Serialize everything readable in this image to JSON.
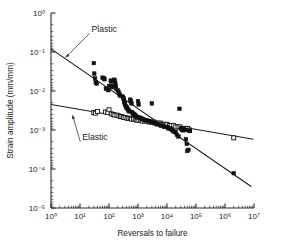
{
  "chart_data": {
    "type": "scatter",
    "title": "",
    "xlabel": "Reversals to failure",
    "ylabel": "Strain amplitude (mm/mm)",
    "xscale": "log",
    "yscale": "log",
    "xlim": [
      1,
      10000000
    ],
    "ylim": [
      1e-05,
      1
    ],
    "grid": false,
    "legend_position": "none",
    "xticks": [
      "10⁰",
      "10¹",
      "10²",
      "10³",
      "10⁴",
      "10⁵",
      "10⁶",
      "10⁷"
    ],
    "xtick_values": [
      1,
      10,
      100,
      1000,
      10000,
      100000,
      1000000,
      10000000
    ],
    "ytick_values": [
      1,
      0.1,
      0.01,
      0.001,
      0.0001,
      1e-05
    ],
    "yticks": [
      "10⁰",
      "10⁻¹",
      "10⁻²",
      "10⁻³",
      "10⁻⁴",
      "10⁻⁵"
    ],
    "annotations": [
      {
        "text": "Plastic",
        "x": 25,
        "y": 0.33,
        "points_to_x": 3.2,
        "points_to_y": 0.072
      },
      {
        "text": "Elastic",
        "x": 12,
        "y": 0.00055,
        "points_to_x": 5.5,
        "points_to_y": 0.0024
      }
    ],
    "series": [
      {
        "name": "Plastic strain amplitude",
        "marker": "filled-square",
        "color": "#111111",
        "fit_line": {
          "x": [
            1,
            8000000
          ],
          "y": [
            0.12,
            3.55e-05
          ],
          "slope_decades_per_decade": -0.5905
        },
        "points": [
          [
            30,
            0.052
          ],
          [
            31,
            0.028
          ],
          [
            33,
            0.021
          ],
          [
            35,
            0.0165
          ],
          [
            38,
            0.0155
          ],
          [
            60,
            0.022
          ],
          [
            66,
            0.0215
          ],
          [
            70,
            0.02
          ],
          [
            78,
            0.0115
          ],
          [
            95,
            0.0105
          ],
          [
            100,
            0.0135
          ],
          [
            115,
            0.0185
          ],
          [
            120,
            0.0175
          ],
          [
            125,
            0.0135
          ],
          [
            128,
            0.0125
          ],
          [
            150,
            0.0195
          ],
          [
            160,
            0.0185
          ],
          [
            165,
            0.0155
          ],
          [
            170,
            0.0135
          ],
          [
            175,
            0.0115
          ],
          [
            200,
            0.0105
          ],
          [
            215,
            0.0095
          ],
          [
            230,
            0.0082
          ],
          [
            245,
            0.0075
          ],
          [
            300,
            0.0072
          ],
          [
            315,
            0.0065
          ],
          [
            330,
            0.0058
          ],
          [
            340,
            0.0052
          ],
          [
            350,
            0.0048
          ],
          [
            360,
            0.0044
          ],
          [
            380,
            0.0041
          ],
          [
            400,
            0.0038
          ],
          [
            420,
            0.0036
          ],
          [
            450,
            0.0034
          ],
          [
            470,
            0.0032
          ],
          [
            500,
            0.003
          ],
          [
            540,
            0.006
          ],
          [
            560,
            0.0056
          ],
          [
            600,
            0.0048
          ],
          [
            620,
            0.0029
          ],
          [
            660,
            0.0027
          ],
          [
            700,
            0.0026
          ],
          [
            740,
            0.0025
          ],
          [
            800,
            0.0024
          ],
          [
            850,
            0.0023
          ],
          [
            900,
            0.0022
          ],
          [
            950,
            0.0021
          ],
          [
            1000,
            0.0055
          ],
          [
            1050,
            0.0045
          ],
          [
            1100,
            0.0021
          ],
          [
            1200,
            0.002
          ],
          [
            1300,
            0.002
          ],
          [
            1400,
            0.0019
          ],
          [
            1500,
            0.0019
          ],
          [
            1700,
            0.0018
          ],
          [
            1900,
            0.0018
          ],
          [
            2200,
            0.0017
          ],
          [
            2500,
            0.0017
          ],
          [
            2800,
            0.0016
          ],
          [
            3000,
            0.0048
          ],
          [
            3200,
            0.0016
          ],
          [
            3600,
            0.0015
          ],
          [
            4000,
            0.0015
          ],
          [
            4500,
            0.0014
          ],
          [
            5200,
            0.0014
          ],
          [
            6000,
            0.0013
          ],
          [
            7000,
            0.0013
          ],
          [
            8000,
            0.0012
          ],
          [
            9000,
            0.0012
          ],
          [
            10000,
            0.0012
          ],
          [
            11000,
            0.0011
          ],
          [
            13000,
            0.0011
          ],
          [
            15000,
            0.001
          ],
          [
            16000,
            0.00095
          ],
          [
            18000,
            0.0009
          ],
          [
            20000,
            0.00088
          ],
          [
            22000,
            0.00075
          ],
          [
            25000,
            0.00068
          ],
          [
            27000,
            0.0035
          ],
          [
            30000,
            0.0011
          ],
          [
            33000,
            0.001
          ],
          [
            36000,
            0.00098
          ],
          [
            38000,
            0.00105
          ],
          [
            42000,
            0.001
          ],
          [
            45000,
            0.00058
          ],
          [
            48000,
            0.00044
          ],
          [
            50000,
            0.00029
          ],
          [
            55000,
            0.00031
          ],
          [
            58000,
            0.00097
          ],
          [
            62000,
            0.00095
          ],
          [
            2000000,
            7.8e-05
          ]
        ]
      },
      {
        "name": "Elastic strain amplitude",
        "marker": "open-square",
        "color": "#ffffff",
        "fit_line": {
          "x": [
            1,
            9500000
          ],
          "y": [
            0.0045,
            0.00058
          ],
          "slope_decades_per_decade": -0.1285
        },
        "points": [
          [
            30,
            0.0028
          ],
          [
            34,
            0.0027
          ],
          [
            40,
            0.003
          ],
          [
            75,
            0.0029
          ],
          [
            90,
            0.0028
          ],
          [
            100,
            0.0033
          ],
          [
            120,
            0.0026
          ],
          [
            140,
            0.0025
          ],
          [
            160,
            0.0024
          ],
          [
            190,
            0.0024
          ],
          [
            220,
            0.0023
          ],
          [
            250,
            0.0022
          ],
          [
            280,
            0.0022
          ],
          [
            320,
            0.0021
          ],
          [
            360,
            0.0021
          ],
          [
            420,
            0.002
          ],
          [
            480,
            0.002
          ],
          [
            540,
            0.002
          ],
          [
            600,
            0.0019
          ],
          [
            700,
            0.0019
          ],
          [
            800,
            0.0019
          ],
          [
            900,
            0.0018
          ],
          [
            1000,
            0.0018
          ],
          [
            1200,
            0.0018
          ],
          [
            1400,
            0.0017
          ],
          [
            1700,
            0.0017
          ],
          [
            2000,
            0.0017
          ],
          [
            2400,
            0.0016
          ],
          [
            2900,
            0.0016
          ],
          [
            3500,
            0.0016
          ],
          [
            4200,
            0.0015
          ],
          [
            5000,
            0.0015
          ],
          [
            6000,
            0.0015
          ],
          [
            7000,
            0.0014
          ],
          [
            8500,
            0.0014
          ],
          [
            10000,
            0.0014
          ],
          [
            12000,
            0.0013
          ],
          [
            14000,
            0.0013
          ],
          [
            17000,
            0.0013
          ],
          [
            20000,
            0.0012
          ],
          [
            24000,
            0.0012
          ],
          [
            28000,
            0.0012
          ],
          [
            33000,
            0.0011
          ],
          [
            38000,
            0.0011
          ],
          [
            45000,
            0.0011
          ],
          [
            52000,
            0.0011
          ],
          [
            60000,
            0.001
          ],
          [
            2000000,
            0.00063
          ]
        ]
      }
    ]
  }
}
